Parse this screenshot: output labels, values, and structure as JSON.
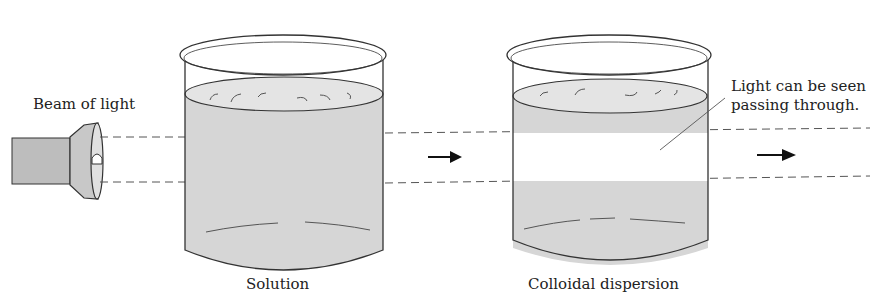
{
  "diagram": {
    "labels": {
      "beam": "Beam of light",
      "solution": "Solution",
      "colloid": "Colloidal dispersion",
      "annotation_line1": "Light can be seen",
      "annotation_line2": "passing through."
    },
    "components": [
      {
        "id": "flashlight",
        "role": "light source"
      },
      {
        "id": "beaker-solution",
        "contents": "Solution",
        "beam_visible": false
      },
      {
        "id": "beaker-colloid",
        "contents": "Colloidal dispersion",
        "beam_visible": true
      }
    ],
    "colors": {
      "liquid": "#d6d6d6",
      "stroke": "#333333",
      "beam_dash": "#555555",
      "background": "#ffffff"
    }
  }
}
